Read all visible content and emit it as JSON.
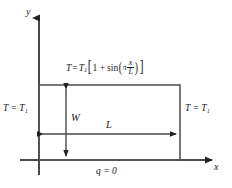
{
  "figure": {
    "type": "2d-heat-conduction-domain-sketch",
    "axes": {
      "x_label": "x",
      "y_label": "y",
      "origin_x": 39,
      "origin_y": 160
    },
    "domain_rect": {
      "left": 39,
      "top": 85,
      "right": 180,
      "bottom": 160,
      "width_label": "W",
      "length_label": "L"
    },
    "boundary_conditions": {
      "left": "T = T₁",
      "right": "T = T₁",
      "bottom": "q = 0",
      "top_expression": {
        "lhs_T": "T",
        "equals": "=",
        "T1_base": "T",
        "T1_sub": "1",
        "open_bracket": "[",
        "one_plus": "1 +",
        "sin": "sin",
        "open_paren": "(",
        "pi": "π",
        "frac_num": "x",
        "frac_den": "L",
        "close_paren": ")",
        "close_bracket": "]",
        "plain_text": "T = T1[1 + sin(π x/L)]"
      }
    },
    "dimensions": {
      "vertical_arrow_label": "W",
      "horizontal_arrow_label": "L"
    },
    "colors": {
      "line": "#4a4a4a",
      "rect_border": "#555555",
      "text": "#1a1a1a",
      "background": "#ffffff",
      "arrow_fill": "#222222"
    }
  }
}
